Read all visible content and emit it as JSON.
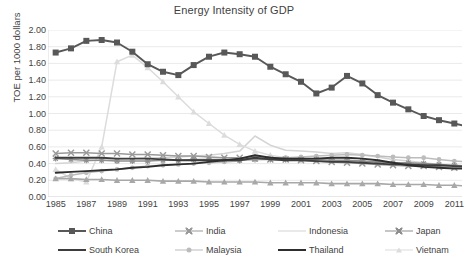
{
  "chart_data": {
    "type": "line",
    "title": "Energy Intensity of GDP",
    "xlabel": "",
    "ylabel": "TOE per 1000 dollars",
    "ylim": [
      0.0,
      2.0
    ],
    "ytick_step": 0.2,
    "ytick_labels": [
      "0.00",
      "0.20",
      "0.40",
      "0.60",
      "0.80",
      "1.00",
      "1.20",
      "1.40",
      "1.60",
      "1.80",
      "2.00"
    ],
    "xlim": [
      1985,
      2012
    ],
    "xtick_labels": [
      "1985",
      "1987",
      "1989",
      "1991",
      "1993",
      "1995",
      "1997",
      "1999",
      "2001",
      "2003",
      "2005",
      "2007",
      "2009",
      "2011"
    ],
    "grid": "horizontal",
    "legend_position": "bottom",
    "x": [
      1985,
      1986,
      1987,
      1988,
      1989,
      1990,
      1991,
      1992,
      1993,
      1994,
      1995,
      1996,
      1997,
      1998,
      1999,
      2000,
      2001,
      2002,
      2003,
      2004,
      2005,
      2006,
      2007,
      2008,
      2009,
      2010,
      2011,
      2012
    ],
    "series": [
      {
        "name": "China",
        "color": "#585858",
        "marker": "square",
        "values": [
          1.73,
          1.78,
          1.87,
          1.88,
          1.85,
          1.74,
          1.59,
          1.5,
          1.46,
          1.58,
          1.68,
          1.73,
          1.71,
          1.68,
          1.56,
          1.47,
          1.38,
          1.24,
          1.31,
          1.45,
          1.36,
          1.22,
          1.13,
          1.05,
          0.97,
          0.92,
          0.88,
          0.84
        ]
      },
      {
        "name": "India",
        "color": "#9a9a9a",
        "marker": "plus",
        "values": [
          0.52,
          0.53,
          0.53,
          0.52,
          0.52,
          0.51,
          0.51,
          0.5,
          0.49,
          0.49,
          0.48,
          0.47,
          0.47,
          0.46,
          0.45,
          0.45,
          0.44,
          0.43,
          0.42,
          0.41,
          0.4,
          0.39,
          0.38,
          0.37,
          0.37,
          0.36,
          0.35,
          0.34
        ]
      },
      {
        "name": "Indonesia",
        "color": "#d4d4d4",
        "marker": "none",
        "values": [
          0.4,
          0.41,
          0.43,
          0.44,
          0.45,
          0.46,
          0.47,
          0.47,
          0.48,
          0.49,
          0.5,
          0.52,
          0.55,
          0.73,
          0.62,
          0.56,
          0.55,
          0.54,
          0.52,
          0.53,
          0.51,
          0.48,
          0.45,
          0.43,
          0.41,
          0.39,
          0.37,
          0.36
        ]
      },
      {
        "name": "Japan",
        "color": "#8e8e8e",
        "marker": "star",
        "values": [
          0.46,
          0.45,
          0.44,
          0.44,
          0.43,
          0.43,
          0.43,
          0.44,
          0.44,
          0.45,
          0.45,
          0.45,
          0.44,
          0.45,
          0.45,
          0.45,
          0.45,
          0.45,
          0.44,
          0.44,
          0.43,
          0.42,
          0.41,
          0.41,
          0.4,
          0.39,
          0.38,
          0.37
        ]
      },
      {
        "name": "South Korea",
        "color": "#3d3d3d",
        "marker": "none",
        "values": [
          0.47,
          0.47,
          0.47,
          0.47,
          0.46,
          0.46,
          0.46,
          0.45,
          0.44,
          0.44,
          0.44,
          0.44,
          0.44,
          0.47,
          0.45,
          0.44,
          0.44,
          0.43,
          0.42,
          0.42,
          0.41,
          0.4,
          0.39,
          0.39,
          0.38,
          0.38,
          0.37,
          0.36
        ]
      },
      {
        "name": "Malaysia",
        "color": "#bcbcbc",
        "marker": "circle",
        "values": [
          0.22,
          0.26,
          0.29,
          0.31,
          0.33,
          0.35,
          0.37,
          0.38,
          0.39,
          0.4,
          0.41,
          0.42,
          0.43,
          0.48,
          0.47,
          0.47,
          0.48,
          0.49,
          0.5,
          0.51,
          0.5,
          0.49,
          0.48,
          0.47,
          0.47,
          0.45,
          0.43,
          0.42
        ]
      },
      {
        "name": "Thailand",
        "color": "#2e2e2e",
        "marker": "none",
        "values": [
          0.29,
          0.3,
          0.31,
          0.32,
          0.33,
          0.35,
          0.36,
          0.38,
          0.39,
          0.4,
          0.42,
          0.44,
          0.46,
          0.5,
          0.47,
          0.46,
          0.46,
          0.46,
          0.47,
          0.47,
          0.46,
          0.44,
          0.41,
          0.38,
          0.36,
          0.35,
          0.34,
          0.34
        ]
      },
      {
        "name": "Vietnam",
        "color": "#dcdcdc",
        "marker": "triangle",
        "values": [
          0.33,
          0.22,
          0.18,
          0.6,
          1.62,
          1.7,
          1.55,
          1.38,
          1.2,
          1.02,
          0.88,
          0.74,
          0.63,
          0.55,
          0.5,
          0.47,
          0.45,
          0.44,
          0.43,
          0.42,
          0.41,
          0.4,
          0.39,
          0.38,
          0.37,
          0.36,
          0.35,
          0.34
        ]
      }
    ],
    "bottom_series_name": "Malaysia-low-band",
    "low_band": {
      "name": "Malaysia",
      "values": [
        0.22,
        0.22,
        0.21,
        0.21,
        0.2,
        0.2,
        0.2,
        0.19,
        0.19,
        0.19,
        0.18,
        0.18,
        0.18,
        0.18,
        0.17,
        0.17,
        0.17,
        0.17,
        0.16,
        0.16,
        0.16,
        0.16,
        0.15,
        0.15,
        0.15,
        0.14,
        0.14,
        0.13
      ]
    }
  },
  "legend": {
    "rows": [
      [
        {
          "label": "China",
          "color": "#585858",
          "marker": "square"
        },
        {
          "label": "India",
          "color": "#9a9a9a",
          "marker": "plus"
        },
        {
          "label": "Indonesia",
          "color": "#d4d4d4",
          "marker": "none"
        },
        {
          "label": "Japan",
          "color": "#8e8e8e",
          "marker": "star"
        }
      ],
      [
        {
          "label": "South Korea",
          "color": "#3d3d3d",
          "marker": "none"
        },
        {
          "label": "Malaysia",
          "color": "#bcbcbc",
          "marker": "circle"
        },
        {
          "label": "Thailand",
          "color": "#2e2e2e",
          "marker": "none"
        },
        {
          "label": "Vietnam",
          "color": "#dcdcdc",
          "marker": "triangle"
        }
      ]
    ]
  },
  "style": {
    "gridline_color": "#eaeaea",
    "axis_color": "#d9d9d9",
    "text_color": "#3f3f3f",
    "background": "#ffffff"
  }
}
